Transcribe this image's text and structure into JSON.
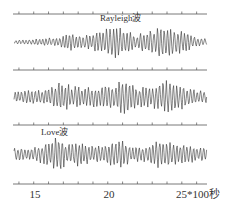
{
  "chart_data": {
    "type": "line",
    "title": "",
    "xlabel": "*100秒",
    "ylabel": "",
    "xlim": [
      13.6,
      26.7
    ],
    "x_ticks": [
      14,
      15,
      16,
      17,
      18,
      19,
      20,
      21,
      22,
      23,
      24,
      25,
      26
    ],
    "x_tick_labels": [
      {
        "value": 15,
        "label": "15"
      },
      {
        "value": 20,
        "label": "20"
      },
      {
        "value": 25,
        "label": "25"
      }
    ],
    "axis_unit_label": "*100秒",
    "grid": false,
    "series": [
      {
        "name": "trace-1",
        "annotation": "Rayleigh波",
        "annotation_x": 20.0,
        "envelope": [
          [
            13.6,
            2
          ],
          [
            15.0,
            3
          ],
          [
            16.5,
            5
          ],
          [
            17.5,
            9
          ],
          [
            18.5,
            7
          ],
          [
            19.5,
            12
          ],
          [
            20.5,
            18
          ],
          [
            21.3,
            14
          ],
          [
            22.0,
            7
          ],
          [
            22.8,
            14
          ],
          [
            23.8,
            17
          ],
          [
            24.5,
            15
          ],
          [
            25.2,
            10
          ],
          [
            26.0,
            5
          ],
          [
            26.7,
            3
          ]
        ]
      },
      {
        "name": "trace-2",
        "annotation": "",
        "envelope": [
          [
            13.6,
            6
          ],
          [
            15.0,
            7
          ],
          [
            16.0,
            9
          ],
          [
            16.7,
            16
          ],
          [
            17.5,
            12
          ],
          [
            18.5,
            10
          ],
          [
            19.5,
            11
          ],
          [
            20.5,
            14
          ],
          [
            21.2,
            18
          ],
          [
            22.0,
            10
          ],
          [
            23.0,
            11
          ],
          [
            24.0,
            17
          ],
          [
            24.8,
            14
          ],
          [
            25.8,
            8
          ],
          [
            26.7,
            6
          ]
        ]
      },
      {
        "name": "trace-3",
        "annotation": "Love波",
        "annotation_x": 16.2,
        "envelope": [
          [
            13.6,
            7
          ],
          [
            15.0,
            7
          ],
          [
            16.0,
            12
          ],
          [
            16.6,
            20
          ],
          [
            17.3,
            10
          ],
          [
            18.2,
            13
          ],
          [
            19.0,
            9
          ],
          [
            20.0,
            11
          ],
          [
            20.9,
            16
          ],
          [
            21.6,
            9
          ],
          [
            22.5,
            8
          ],
          [
            23.0,
            14
          ],
          [
            24.0,
            14
          ],
          [
            25.0,
            10
          ],
          [
            26.7,
            7
          ]
        ]
      }
    ]
  },
  "labels": {
    "rayleigh": "Rayleigh波",
    "love": "Love波",
    "tick_15": "15",
    "tick_20": "20",
    "tick_25": "25*100秒"
  }
}
